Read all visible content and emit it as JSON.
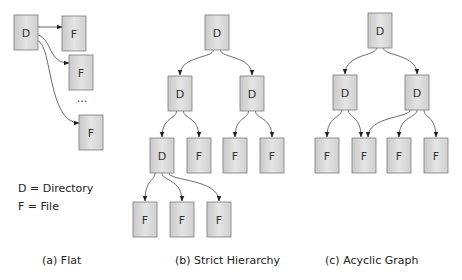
{
  "legend": {
    "line1": "D = Directory",
    "line2": "F = File"
  },
  "ellipsis": "...",
  "panels": [
    {
      "id": "flat",
      "caption": "(a) Flat",
      "nodes": [
        {
          "id": "d0",
          "label": "D"
        },
        {
          "id": "f1",
          "label": "F"
        },
        {
          "id": "f2",
          "label": "F"
        },
        {
          "id": "f3",
          "label": "F"
        }
      ],
      "edges": [
        [
          "d0",
          "f1"
        ],
        [
          "d0",
          "f2"
        ],
        [
          "d0",
          "f3"
        ]
      ]
    },
    {
      "id": "strict",
      "caption": "(b) Strict Hierarchy",
      "nodes": [
        {
          "id": "root",
          "label": "D"
        },
        {
          "id": "dl",
          "label": "D"
        },
        {
          "id": "dr",
          "label": "D"
        },
        {
          "id": "d3",
          "label": "D"
        },
        {
          "id": "f3a",
          "label": "F"
        },
        {
          "id": "f3b",
          "label": "F"
        },
        {
          "id": "f3c",
          "label": "F"
        },
        {
          "id": "f4a",
          "label": "F"
        },
        {
          "id": "f4b",
          "label": "F"
        },
        {
          "id": "f4c",
          "label": "F"
        }
      ],
      "edges": [
        [
          "root",
          "dl"
        ],
        [
          "root",
          "dr"
        ],
        [
          "dl",
          "d3"
        ],
        [
          "dl",
          "f3a"
        ],
        [
          "dr",
          "f3b"
        ],
        [
          "dr",
          "f3c"
        ],
        [
          "d3",
          "f4a"
        ],
        [
          "d3",
          "f4b"
        ],
        [
          "d3",
          "f4c"
        ]
      ]
    },
    {
      "id": "acyclic",
      "caption": "(c) Acyclic Graph",
      "nodes": [
        {
          "id": "root",
          "label": "D"
        },
        {
          "id": "dl",
          "label": "D"
        },
        {
          "id": "dr",
          "label": "D"
        },
        {
          "id": "fa",
          "label": "F"
        },
        {
          "id": "fb",
          "label": "F"
        },
        {
          "id": "fc",
          "label": "F"
        },
        {
          "id": "fd",
          "label": "F"
        }
      ],
      "edges": [
        [
          "root",
          "dl"
        ],
        [
          "root",
          "dr"
        ],
        [
          "dl",
          "fa"
        ],
        [
          "dl",
          "fb"
        ],
        [
          "dr",
          "fb"
        ],
        [
          "dr",
          "fc"
        ],
        [
          "dr",
          "fd"
        ]
      ]
    }
  ]
}
